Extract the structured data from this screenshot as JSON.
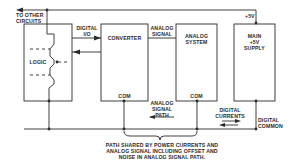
{
  "colors": {
    "line": "#2a2a2a",
    "background": "#ffffff"
  },
  "blocks": {
    "logic": {
      "label": "LOGIC"
    },
    "converter": {
      "label": "CONVERTER",
      "com": "COM"
    },
    "analog_system": {
      "label_line1": "ANALOG",
      "label_line2": "SYSTEM",
      "com": "COM"
    },
    "main_supply": {
      "label_line1": "MAIN",
      "label_line2": "+5V",
      "label_line3": "SUPPLY"
    }
  },
  "labels": {
    "to_other_circuits_line1": "TO OTHER",
    "to_other_circuits_line2": "CIRCUITS",
    "digital_io_line1": "DIGITAL",
    "digital_io_line2": "I/O",
    "analog_signal_line1": "ANALOG",
    "analog_signal_line2": "SIGNAL",
    "plus5v": "+5V",
    "analog_signal_path_line1": "ANALOG",
    "analog_signal_path_line2": "SIGNAL",
    "analog_signal_path_line3": "PATH",
    "digital_currents_line1": "DIGITAL",
    "digital_currents_line2": "CURRENTS",
    "digital_common_line1": "DIGITAL",
    "digital_common_line2": "COMMON",
    "caption_line1": "PATH SHARED BY POWER CURRENTS AND",
    "caption_line2": "ANALOG SIGNAL INCLUDING OFFSET AND",
    "caption_line3": "NOISE IN ANALOG SIGNAL PATH."
  }
}
